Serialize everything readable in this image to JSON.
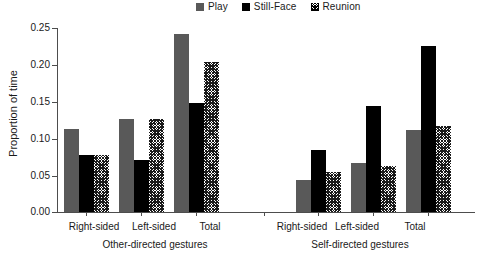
{
  "chart_data": {
    "type": "bar",
    "title": "",
    "xlabel": "",
    "ylabel": "Proportion of time",
    "ylim": [
      0.0,
      0.25
    ],
    "ytick_labels": [
      "0.25",
      "0.20",
      "0.15",
      "0.10",
      "0.05",
      "0.00"
    ],
    "ytick_values": [
      0.25,
      0.2,
      0.15,
      0.1,
      0.05,
      0.0
    ],
    "grid": false,
    "legend_position": "top-center",
    "legend": [
      "Play",
      "Still-Face",
      "Reunion"
    ],
    "group_labels": [
      "Other-directed gestures",
      "Self-directed gestures"
    ],
    "categories": [
      "Right-sided",
      "Left-sided",
      "Total",
      "Right-sided",
      "Left-sided",
      "Total"
    ],
    "series": [
      {
        "name": "Play",
        "values": [
          0.113,
          0.127,
          0.242,
          0.044,
          0.067,
          0.111
        ]
      },
      {
        "name": "Still-Face",
        "values": [
          0.077,
          0.071,
          0.148,
          0.084,
          0.144,
          0.226
        ]
      },
      {
        "name": "Reunion",
        "values": [
          0.077,
          0.127,
          0.204,
          0.054,
          0.063,
          0.117
        ]
      }
    ],
    "colors": {
      "play": "#595959",
      "still_face": "#000000",
      "reunion": "#ffffff"
    }
  },
  "legend": {
    "items": [
      {
        "label": "Play",
        "icon": "square-filled-gray-icon"
      },
      {
        "label": "Still-Face",
        "icon": "square-filled-black-icon"
      },
      {
        "label": "Reunion",
        "icon": "square-hatched-icon"
      }
    ]
  },
  "axes": {
    "y": {
      "title": "Proportion of time",
      "ticks": [
        "0.25",
        "0.20",
        "0.15",
        "0.10",
        "0.05",
        "0.00"
      ]
    },
    "x": {
      "categories": [
        "Right-sided",
        "Left-sided",
        "Total",
        "Right-sided",
        "Left-sided",
        "Total"
      ],
      "groups": [
        "Other-directed gestures",
        "Self-directed gestures"
      ]
    }
  }
}
